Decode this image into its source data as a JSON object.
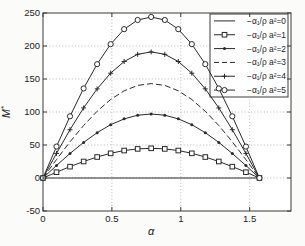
{
  "figure": {
    "xlabel": "α",
    "ylabel_base": "M",
    "ylabel_sup": "*"
  },
  "colors": {
    "line": "#2a2a2a",
    "grid": "#9a9a9a",
    "axis": "#3a3a3a",
    "plot_bg": "#ffffff",
    "page_bg": "#fbfbf9",
    "text": "#222222"
  },
  "axes": {
    "xtick_labels": [
      "0",
      "0.5",
      "1",
      "1.5"
    ],
    "ytick_labels": [
      "-50",
      "0",
      "50",
      "100",
      "150",
      "200",
      "250"
    ]
  },
  "chart_data": {
    "type": "line",
    "title": "",
    "xlabel": "α",
    "ylabel": "M*",
    "xlim": [
      0,
      1.8
    ],
    "ylim": [
      -50,
      250
    ],
    "xticks": [
      0,
      0.5,
      1,
      1.5
    ],
    "yticks": [
      -50,
      0,
      50,
      100,
      150,
      200,
      250
    ],
    "grid": "on",
    "legend_position": "northeast",
    "x": [
      0,
      0.098,
      0.196,
      0.295,
      0.393,
      0.491,
      0.589,
      0.687,
      0.785,
      0.884,
      0.982,
      1.08,
      1.178,
      1.276,
      1.374,
      1.473,
      1.571
    ],
    "series": [
      {
        "label": "−α₁/ρ a²=0",
        "a2": 0,
        "peak": 0,
        "linestyle": "solid",
        "marker": "none",
        "y": [
          0,
          0,
          0,
          0,
          0,
          0,
          0,
          0,
          0,
          0,
          0,
          0,
          0,
          0,
          0,
          0,
          0
        ]
      },
      {
        "label": "−α₁/ρ a²=1",
        "a2": 1,
        "peak": 45,
        "linestyle": "solid",
        "marker": "square",
        "y": [
          0,
          8.8,
          17.2,
          25.0,
          31.8,
          37.4,
          41.6,
          44.1,
          45,
          44.1,
          41.6,
          37.4,
          31.8,
          25.0,
          17.2,
          8.8,
          0
        ]
      },
      {
        "label": "−α₁/ρ a²=2",
        "a2": 2,
        "peak": 97,
        "linestyle": "solid",
        "marker": "dot",
        "y": [
          0,
          18.9,
          37.1,
          53.9,
          68.6,
          80.7,
          89.6,
          95.2,
          97,
          95.2,
          89.6,
          80.7,
          68.6,
          53.9,
          37.1,
          18.9,
          0
        ]
      },
      {
        "label": "−α₁/ρ a²=3",
        "a2": 3,
        "peak": 143,
        "linestyle": "dashed",
        "marker": "none",
        "y": [
          0,
          27.9,
          54.8,
          79.5,
          101.1,
          118.9,
          132.1,
          140.3,
          143,
          140.3,
          132.1,
          118.9,
          101.1,
          79.5,
          54.8,
          27.9,
          0
        ]
      },
      {
        "label": "−α₁/ρ a²=4",
        "a2": 4,
        "peak": 191,
        "linestyle": "solid",
        "marker": "plus",
        "y": [
          0,
          37.3,
          73.2,
          106.2,
          135.0,
          158.8,
          176.5,
          187.4,
          191,
          187.4,
          176.5,
          158.8,
          135.0,
          106.2,
          73.2,
          37.3,
          0
        ]
      },
      {
        "label": "−α₁/ρ a²=5",
        "a2": 5,
        "peak": 244,
        "linestyle": "solid",
        "marker": "circle",
        "y": [
          0,
          47.6,
          93.5,
          135.7,
          172.5,
          202.8,
          225.5,
          239.4,
          244,
          239.4,
          225.5,
          202.8,
          172.5,
          135.7,
          93.5,
          47.6,
          0
        ]
      }
    ]
  }
}
